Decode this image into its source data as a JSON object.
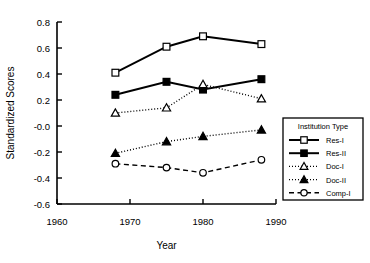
{
  "chart_data": {
    "type": "line",
    "title": "",
    "xlabel": "Year",
    "ylabel": "Standardized Scores",
    "xlim": [
      1960,
      1990
    ],
    "ylim": [
      -0.6,
      0.8
    ],
    "xticks": [
      "1960",
      "1970",
      "1980",
      "1990"
    ],
    "xtick_values": [
      1960,
      1970,
      1980,
      1990
    ],
    "yticks": [
      "0.8",
      "0.6",
      "0.4",
      "0.2",
      "-0.0",
      "-0.2",
      "-0.4",
      "-0.6"
    ],
    "ytick_values": [
      0.8,
      0.6,
      0.4,
      0.2,
      0.0,
      -0.2,
      -0.4,
      -0.6
    ],
    "grid": false,
    "legend_position": "right-inside",
    "legend_title": "Institution Type",
    "x": [
      1968,
      1975,
      1980,
      1988
    ],
    "series": [
      {
        "name": "Res-I",
        "marker": "open-square",
        "linestyle": "solid",
        "values": [
          0.41,
          0.61,
          0.69,
          0.63
        ]
      },
      {
        "name": "Res-II",
        "marker": "filled-square",
        "linestyle": "solid",
        "values": [
          0.24,
          0.34,
          0.28,
          0.36
        ]
      },
      {
        "name": "Doc-I",
        "marker": "open-triangle",
        "linestyle": "dotted",
        "values": [
          0.1,
          0.14,
          0.32,
          0.21
        ]
      },
      {
        "name": "Doc-II",
        "marker": "filled-triangle",
        "linestyle": "dotted",
        "values": [
          -0.21,
          -0.12,
          -0.08,
          -0.03
        ]
      },
      {
        "name": "Comp-I",
        "marker": "open-circle",
        "linestyle": "dashed",
        "values": [
          -0.29,
          -0.32,
          -0.36,
          -0.26
        ]
      }
    ],
    "colors": {
      "axis": "#000000",
      "line": "#000000",
      "marker_fill_open": "#ffffff",
      "marker_fill_closed": "#000000",
      "background": "#ffffff"
    }
  }
}
